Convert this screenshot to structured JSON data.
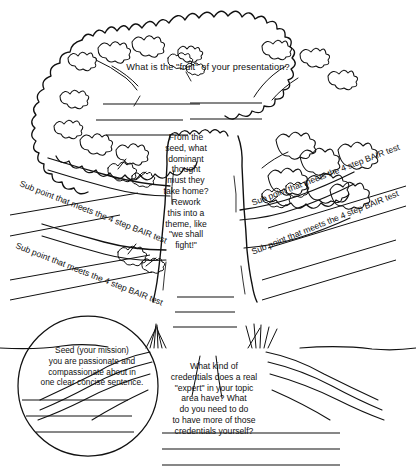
{
  "worksheet": {
    "title": "Presentation Tree Worksheet",
    "style": "hand-drawn black ink line art on white paper",
    "ink_color": "#111111",
    "paper_color": "#ffffff"
  },
  "canopy": {
    "label": "tree-canopy",
    "prompt": "What is the \"fruit\" of your presentation?",
    "write_lines": 5,
    "write_line_columns": 2
  },
  "trunk": {
    "label": "tree-trunk",
    "prompt": "From the\nseed, what\ndominant\nthought\nmust they\ntake home?\nRework\nthis into a\ntheme, like\n\"we shall\nfight!\"",
    "prompt_plain": "From the seed, what dominant thought must they take home? Rework this into a theme, like \"we shall fight!\"",
    "write_lines": 3
  },
  "branches": [
    {
      "id": "left-upper",
      "label": "Sub point that meets the 4 step BAIR test",
      "side": "left",
      "write_lines": 2
    },
    {
      "id": "left-lower",
      "label": "Sub point that meets the 4 step BAIR test",
      "side": "left",
      "write_lines": 2
    },
    {
      "id": "right-upper",
      "label": "Sub point that meets the 4 step BAIR test",
      "side": "right",
      "write_lines": 2
    },
    {
      "id": "right-lower",
      "label": "Sub point that meets the 4 step BAIR test",
      "side": "right",
      "write_lines": 2
    }
  ],
  "seed": {
    "label": "seed-circle",
    "prompt": "Seed (your mission)\nyou are passionate and\ncompassionate about in\none clear concise sentence.",
    "prompt_plain": "Seed (your mission) you are passionate and compassionate about in one clear concise sentence.",
    "write_lines": 3
  },
  "roots": {
    "label": "tree-roots",
    "prompt": "What kind of\ncredentials does a real\n\"expert\" in your topic\narea have? What\ndo you need to do\nto have more of those\ncredentials yourself?",
    "prompt_plain": "What kind of credentials does a real \"expert\" in your topic area have? What do you need to do to have more of those credentials yourself?",
    "write_lines": 3
  }
}
